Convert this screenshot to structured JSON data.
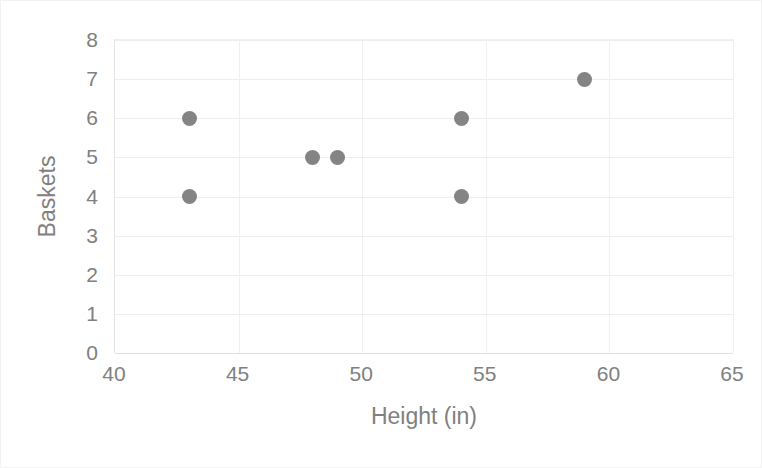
{
  "chart_data": {
    "type": "scatter",
    "title": "",
    "xlabel": "Height (in)",
    "ylabel": "Baskets",
    "xlim": [
      40,
      65
    ],
    "ylim": [
      0,
      8
    ],
    "xticks": [
      40,
      45,
      50,
      55,
      60,
      65
    ],
    "yticks": [
      0,
      1,
      2,
      3,
      4,
      5,
      6,
      7,
      8
    ],
    "grid": true,
    "legend": null,
    "marker_color": "#848484",
    "series": [
      {
        "name": "",
        "points": [
          {
            "x": 43,
            "y": 6
          },
          {
            "x": 43,
            "y": 4
          },
          {
            "x": 48,
            "y": 5
          },
          {
            "x": 49,
            "y": 5
          },
          {
            "x": 54,
            "y": 6
          },
          {
            "x": 54,
            "y": 4
          },
          {
            "x": 59,
            "y": 7
          }
        ]
      }
    ]
  },
  "axes": {
    "x_title": "Height (in)",
    "y_title": "Baskets",
    "x_tick_labels": [
      "40",
      "45",
      "50",
      "55",
      "60",
      "65"
    ],
    "y_tick_labels": [
      "0",
      "1",
      "2",
      "3",
      "4",
      "5",
      "6",
      "7",
      "8"
    ]
  },
  "colors": {
    "marker": "#848484",
    "text": "#808080",
    "gridline": "#ededed",
    "axis": "#e0e0e0",
    "background": "#ffffff"
  }
}
